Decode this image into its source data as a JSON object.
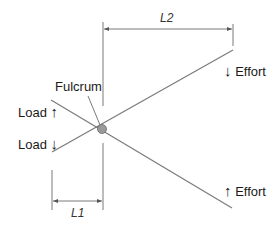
{
  "diagram": {
    "labels": {
      "fulcrum": "Fulcrum",
      "load_up": "Load",
      "load_down": "Load",
      "effort_down": "Effort",
      "effort_up": "Effort",
      "l1": "L1",
      "l2": "L2"
    },
    "arrows": {
      "up": "🡅",
      "down": "🡇"
    },
    "colors": {
      "line": "#7a7a7a",
      "fulcrum_fill": "#9a9a9a",
      "text": "#1a1a1a"
    }
  }
}
